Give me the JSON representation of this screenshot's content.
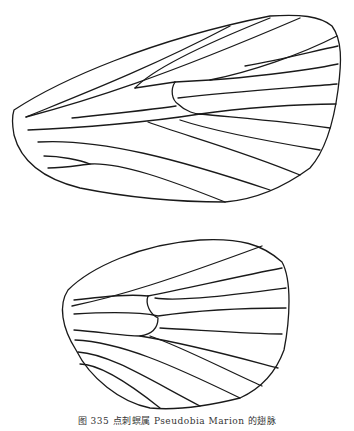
{
  "figure": {
    "caption": "图 335 点刺螟属 Pseudobia Marion 的翅脉",
    "panels": [
      {
        "name": "forewing",
        "label": "前翅"
      },
      {
        "name": "hindwing",
        "label": "后翅"
      }
    ],
    "line_color": "#1a1a1a",
    "background": "#ffffff"
  }
}
